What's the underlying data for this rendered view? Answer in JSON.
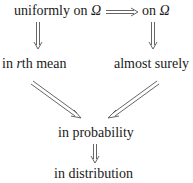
{
  "diagram": {
    "nodes": {
      "uniform": {
        "prefix": "uniformly on ",
        "symbol": "Ω"
      },
      "pointwise": {
        "prefix": "on ",
        "symbol": "Ω"
      },
      "rth_mean": {
        "prefix": "in ",
        "var": "r",
        "suffix": "th mean"
      },
      "almost_surely": {
        "label": "almost surely"
      },
      "probability": {
        "label": "in probability"
      },
      "distribution": {
        "label": "in distribution"
      }
    },
    "edges": [
      {
        "from": "uniform",
        "to": "pointwise",
        "type": "double-arrow"
      },
      {
        "from": "uniform",
        "to": "rth_mean",
        "type": "double-arrow"
      },
      {
        "from": "pointwise",
        "to": "almost_surely",
        "type": "double-arrow"
      },
      {
        "from": "rth_mean",
        "to": "probability",
        "type": "double-arrow"
      },
      {
        "from": "almost_surely",
        "to": "probability",
        "type": "double-arrow"
      },
      {
        "from": "probability",
        "to": "distribution",
        "type": "double-arrow"
      }
    ]
  }
}
